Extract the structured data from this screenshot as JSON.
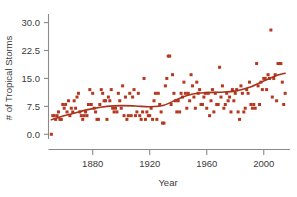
{
  "chart_data": {
    "type": "scatter",
    "title": "",
    "xlabel": "Year",
    "ylabel": "# of Tropical Storms",
    "xlim": [
      1849,
      2017
    ],
    "ylim": [
      -1.0,
      31.5
    ],
    "grid": false,
    "legend": "none",
    "accent_color": "#b4381f",
    "trend_line_color": "#a8321c",
    "axis_color": "#8a8a8a",
    "text_color": "#3b3b3b",
    "xticks": [
      1880,
      1920,
      1960,
      2000
    ],
    "xtick_labels": [
      "1880",
      "1920",
      "1960",
      "2000"
    ],
    "yticks": [
      0.0,
      7.5,
      15.0,
      22.5,
      30.0
    ],
    "ytick_labels": [
      "0.0",
      "7.5",
      "15.0",
      "22.5",
      "30.0"
    ],
    "series": [
      {
        "name": "Tropical storms per year",
        "marker": "square",
        "x": [
          1851,
          1852,
          1853,
          1854,
          1855,
          1856,
          1857,
          1858,
          1859,
          1860,
          1861,
          1862,
          1863,
          1864,
          1865,
          1866,
          1867,
          1868,
          1869,
          1870,
          1871,
          1872,
          1873,
          1874,
          1875,
          1876,
          1877,
          1878,
          1879,
          1880,
          1881,
          1882,
          1883,
          1884,
          1885,
          1886,
          1887,
          1888,
          1889,
          1890,
          1891,
          1892,
          1893,
          1894,
          1895,
          1896,
          1897,
          1898,
          1899,
          1900,
          1901,
          1902,
          1903,
          1904,
          1905,
          1906,
          1907,
          1908,
          1909,
          1910,
          1911,
          1912,
          1913,
          1914,
          1915,
          1916,
          1917,
          1918,
          1919,
          1920,
          1921,
          1922,
          1923,
          1924,
          1925,
          1926,
          1927,
          1928,
          1929,
          1930,
          1931,
          1932,
          1933,
          1934,
          1935,
          1936,
          1937,
          1938,
          1939,
          1940,
          1941,
          1942,
          1943,
          1944,
          1945,
          1946,
          1947,
          1948,
          1949,
          1950,
          1951,
          1952,
          1953,
          1954,
          1955,
          1956,
          1957,
          1958,
          1959,
          1960,
          1961,
          1962,
          1963,
          1964,
          1965,
          1966,
          1967,
          1968,
          1969,
          1970,
          1971,
          1972,
          1973,
          1974,
          1975,
          1976,
          1977,
          1978,
          1979,
          1980,
          1981,
          1982,
          1983,
          1984,
          1985,
          1986,
          1987,
          1988,
          1989,
          1990,
          1991,
          1992,
          1993,
          1994,
          1995,
          1996,
          1997,
          1998,
          1999,
          2000,
          2001,
          2002,
          2003,
          2004,
          2005,
          2006,
          2007,
          2008,
          2009,
          2010,
          2011,
          2012,
          2013,
          2014,
          2015
        ],
        "y": [
          0,
          5,
          5,
          4,
          5,
          6,
          4,
          4,
          8,
          7,
          8,
          6,
          9,
          5,
          7,
          6,
          9,
          7,
          10,
          11,
          6,
          5,
          4,
          5,
          6,
          5,
          8,
          12,
          8,
          11,
          7,
          6,
          4,
          4,
          8,
          12,
          11,
          9,
          9,
          4,
          10,
          9,
          12,
          7,
          6,
          7,
          6,
          11,
          9,
          7,
          13,
          5,
          10,
          4,
          5,
          11,
          5,
          10,
          12,
          5,
          6,
          11,
          5,
          4,
          6,
          15,
          4,
          6,
          5,
          5,
          7,
          4,
          9,
          11,
          4,
          11,
          8,
          6,
          3,
          3,
          13,
          15,
          21,
          21,
          8,
          16,
          11,
          9,
          6,
          9,
          6,
          11,
          10,
          14,
          11,
          7,
          11,
          9,
          16,
          13,
          10,
          7,
          14,
          11,
          12,
          8,
          8,
          10,
          11,
          7,
          11,
          5,
          9,
          12,
          6,
          11,
          8,
          8,
          18,
          10,
          13,
          7,
          8,
          11,
          9,
          10,
          6,
          12,
          9,
          11,
          12,
          6,
          4,
          13,
          11,
          6,
          7,
          12,
          11,
          14,
          8,
          7,
          8,
          7,
          19,
          13,
          8,
          14,
          12,
          15,
          15,
          12,
          16,
          15,
          28,
          10,
          15,
          16,
          9,
          19,
          19,
          19,
          14,
          8,
          11
        ]
      }
    ],
    "trend": {
      "name": "smoothed trend",
      "x": [
        1851,
        1860,
        1870,
        1880,
        1890,
        1900,
        1910,
        1920,
        1930,
        1940,
        1950,
        1960,
        1970,
        1980,
        1990,
        2000,
        2010,
        2015
      ],
      "y": [
        3.9,
        5.0,
        6.0,
        6.9,
        7.5,
        7.7,
        7.6,
        7.4,
        7.8,
        9.5,
        10.8,
        11.2,
        11.3,
        11.6,
        12.6,
        14.3,
        15.9,
        16.4
      ]
    }
  },
  "axis": {
    "ylabel": "# of Tropical Storms",
    "xlabel": "Year"
  }
}
